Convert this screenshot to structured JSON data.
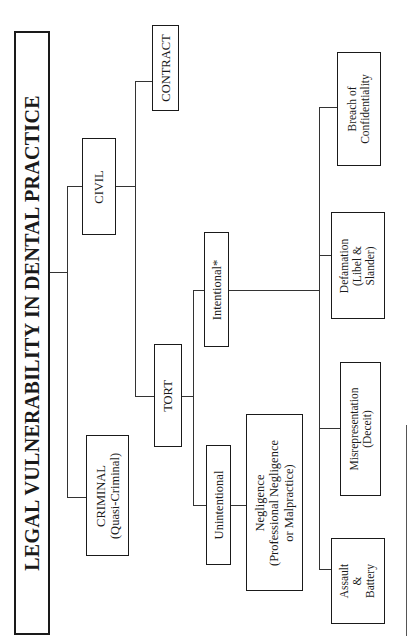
{
  "title": "LEGAL VULNERABILITY IN DENTAL PRACTICE",
  "nodes": {
    "criminal": {
      "line1": "CRIMINAL",
      "line2": "(Quasi-Criminal)"
    },
    "civil": {
      "label": "CIVIL"
    },
    "contract": {
      "label": "CONTRACT"
    },
    "tort": {
      "label": "TORT"
    },
    "intentional": {
      "label": "Intentional*"
    },
    "unintentional": {
      "label": "Unintentional"
    },
    "negligence": {
      "line1": "Negligence",
      "line2": "(Professional Negligence",
      "line3": "or Malpractice)"
    },
    "assault": {
      "line1": "Assault",
      "line2": "&",
      "line3": "Battery"
    },
    "misrepresentation": {
      "line1": "Misrepresentation",
      "line2": "(Deceit)"
    },
    "defamation": {
      "line1": "Defamation",
      "line2": "(Libel &",
      "line3": "Slander)"
    },
    "breach": {
      "line1": "Breach of",
      "line2": "Confidentiality"
    }
  },
  "hierarchy": {
    "root": "LEGAL VULNERABILITY IN DENTAL PRACTICE",
    "children": [
      {
        "name": "CRIMINAL (Quasi-Criminal)"
      },
      {
        "name": "CIVIL",
        "children": [
          {
            "name": "CONTRACT"
          },
          {
            "name": "TORT",
            "children": [
              {
                "name": "Unintentional",
                "children": [
                  {
                    "name": "Negligence (Professional Negligence or Malpractice)"
                  }
                ]
              },
              {
                "name": "Intentional*",
                "children": [
                  {
                    "name": "Assault & Battery"
                  },
                  {
                    "name": "Misrepresentation (Deceit)"
                  },
                  {
                    "name": "Defamation (Libel & Slander)"
                  },
                  {
                    "name": "Breach of Confidentiality"
                  }
                ]
              }
            ]
          }
        ]
      }
    ]
  }
}
